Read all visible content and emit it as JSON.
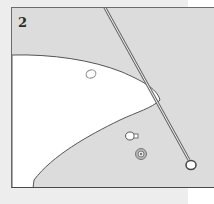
{
  "panel": {
    "step_number": "2"
  },
  "colors": {
    "panel_fill": "#dcdcdc",
    "shape_fill": "#ffffff",
    "outline": "#555555",
    "page_bg": "#ededed"
  },
  "illustration": {
    "objects": [
      {
        "name": "white-curved-shape"
      },
      {
        "name": "diagonal-pin"
      },
      {
        "name": "pin-head-loop"
      },
      {
        "name": "small-ring-outline"
      },
      {
        "name": "small-bead-piece"
      },
      {
        "name": "round-button-coin"
      }
    ]
  }
}
